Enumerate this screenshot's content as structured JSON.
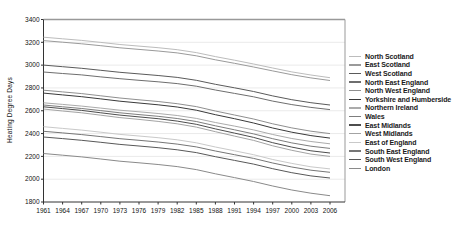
{
  "chart_data": {
    "type": "line",
    "title": "",
    "xlabel": "",
    "ylabel": "Heating Degree Days",
    "ylim": [
      1800,
      3400
    ],
    "ytick_step": 200,
    "grid": "horizontal",
    "legend_position": "right",
    "x": [
      1961,
      1964,
      1967,
      1970,
      1973,
      1976,
      1979,
      1982,
      1985,
      1988,
      1991,
      1994,
      1997,
      2000,
      2003,
      2006
    ],
    "series": [
      {
        "name": "North Scotland",
        "color": "#bcbcbc",
        "values": [
          3245,
          3231,
          3217,
          3199,
          3181,
          3167,
          3153,
          3135,
          3110,
          3075,
          3043,
          3010,
          2975,
          2941,
          2913,
          2890
        ]
      },
      {
        "name": "East Scotland",
        "color": "#9a9a9a",
        "values": [
          3215,
          3201,
          3187,
          3170,
          3152,
          3138,
          3124,
          3107,
          3082,
          3047,
          3016,
          2984,
          2949,
          2916,
          2888,
          2865
        ]
      },
      {
        "name": "West Scotland",
        "color": "#5a5a5a",
        "values": [
          3000,
          2986,
          2972,
          2955,
          2937,
          2923,
          2909,
          2892,
          2867,
          2832,
          2801,
          2769,
          2730,
          2697,
          2671,
          2650
        ]
      },
      {
        "name": "North East England",
        "color": "#6e6e6e",
        "values": [
          2940,
          2927,
          2914,
          2897,
          2881,
          2867,
          2854,
          2838,
          2815,
          2782,
          2752,
          2722,
          2685,
          2654,
          2629,
          2610
        ]
      },
      {
        "name": "North West England",
        "color": "#8f8f8f",
        "values": [
          2780,
          2765,
          2750,
          2731,
          2712,
          2696,
          2681,
          2662,
          2636,
          2598,
          2563,
          2528,
          2486,
          2450,
          2421,
          2400
        ]
      },
      {
        "name": "Yorkshire and Humberside",
        "color": "#3a3a3a",
        "values": [
          2755,
          2739,
          2723,
          2704,
          2684,
          2668,
          2652,
          2633,
          2605,
          2565,
          2530,
          2493,
          2449,
          2412,
          2382,
          2360
        ]
      },
      {
        "name": "Northern Ireland",
        "color": "#ababab",
        "values": [
          2670,
          2656,
          2641,
          2623,
          2605,
          2591,
          2576,
          2558,
          2533,
          2497,
          2465,
          2432,
          2392,
          2357,
          2330,
          2310
        ]
      },
      {
        "name": "Wales",
        "color": "#7d7d7d",
        "values": [
          2650,
          2635,
          2620,
          2601,
          2582,
          2566,
          2551,
          2532,
          2506,
          2468,
          2433,
          2397,
          2355,
          2318,
          2289,
          2270
        ]
      },
      {
        "name": "East Midlands",
        "color": "#4d4d4d",
        "values": [
          2635,
          2619,
          2603,
          2582,
          2562,
          2546,
          2530,
          2509,
          2481,
          2441,
          2404,
          2366,
          2320,
          2281,
          2249,
          2230
        ]
      },
      {
        "name": "West Midlands",
        "color": "#a3a3a3",
        "values": [
          2615,
          2598,
          2582,
          2561,
          2540,
          2524,
          2507,
          2486,
          2457,
          2416,
          2378,
          2340,
          2293,
          2253,
          2220,
          2200
        ]
      },
      {
        "name": "East of England",
        "color": "#c9c9c9",
        "values": [
          2460,
          2445,
          2430,
          2412,
          2393,
          2379,
          2364,
          2345,
          2319,
          2282,
          2249,
          2215,
          2173,
          2138,
          2109,
          2090
        ]
      },
      {
        "name": "South East England",
        "color": "#767676",
        "values": [
          2420,
          2406,
          2391,
          2373,
          2355,
          2341,
          2326,
          2308,
          2283,
          2247,
          2215,
          2182,
          2142,
          2107,
          2079,
          2060
        ]
      },
      {
        "name": "South West England",
        "color": "#585858",
        "values": [
          2370,
          2356,
          2341,
          2323,
          2305,
          2291,
          2276,
          2258,
          2233,
          2197,
          2165,
          2132,
          2092,
          2057,
          2029,
          2010
        ]
      },
      {
        "name": "London",
        "color": "#8a8a8a",
        "values": [
          2225,
          2210,
          2195,
          2177,
          2158,
          2144,
          2129,
          2110,
          2084,
          2047,
          2014,
          1980,
          1940,
          1905,
          1877,
          1855
        ]
      }
    ]
  },
  "colors": {
    "axis": "#333333",
    "frame": "#999999",
    "grid": "#eaeaea",
    "tick_label": "#111111",
    "background": "#ffffff"
  }
}
